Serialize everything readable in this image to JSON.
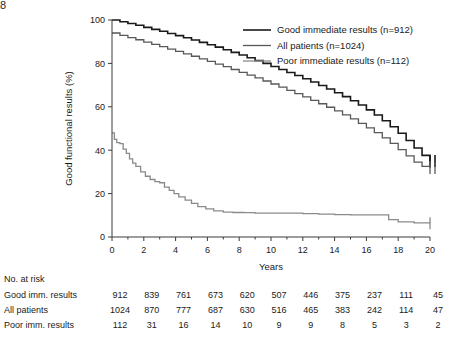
{
  "page_number": "8",
  "chart_data": {
    "type": "line",
    "title": "",
    "xlabel": "Years",
    "ylabel": "Good functional results (%)",
    "xlim": [
      0,
      20
    ],
    "ylim": [
      0,
      100
    ],
    "xticks": [
      0,
      2,
      4,
      6,
      8,
      10,
      12,
      14,
      16,
      18,
      20
    ],
    "xtick_labels": [
      "0",
      "2",
      "4",
      "6",
      "8",
      "10",
      "12",
      "14",
      "16",
      "18",
      "20"
    ],
    "yticks": [
      0,
      20,
      40,
      60,
      80,
      100
    ],
    "ytick_labels": [
      "0",
      "20",
      "40",
      "60",
      "80",
      "100"
    ],
    "xminor_interval": 1,
    "grid": false,
    "legend_position": "top-right",
    "series": [
      {
        "name": "Good immediate results (n=912)",
        "color": "#1a1a1a",
        "width": 1.6,
        "x": [
          0,
          0.5,
          1,
          1.5,
          2,
          2.5,
          3,
          3.5,
          4,
          4.5,
          5,
          5.5,
          6,
          6.5,
          7,
          7.5,
          8,
          8.5,
          9,
          9.5,
          10,
          10.5,
          11,
          11.5,
          12,
          12.5,
          13,
          13.5,
          14,
          14.5,
          15,
          15.5,
          16,
          16.5,
          17,
          17.5,
          18,
          18.5,
          19,
          19.5,
          20
        ],
        "y": [
          100,
          99.2,
          98.4,
          97.6,
          96.6,
          95.7,
          94.8,
          93.8,
          92.8,
          91.8,
          90.8,
          89.7,
          88.6,
          87.5,
          86.3,
          85.1,
          83.9,
          82.6,
          81.3,
          80.0,
          78.6,
          77.2,
          75.8,
          74.4,
          72.9,
          71.4,
          69.8,
          68.2,
          66.5,
          64.7,
          62.8,
          60.8,
          58.6,
          56.2,
          53.6,
          50.8,
          47.8,
          44.5,
          41.0,
          37.6,
          35.0
        ],
        "censor_x": [
          20,
          20
        ],
        "censor_y": [
          35.0,
          35.0
        ]
      },
      {
        "name": "All patients (n=1024)",
        "color": "#585858",
        "width": 1.3,
        "x": [
          0,
          0.5,
          1,
          1.5,
          2,
          2.5,
          3,
          3.5,
          4,
          4.5,
          5,
          5.5,
          6,
          6.5,
          7,
          7.5,
          8,
          8.5,
          9,
          9.5,
          10,
          10.5,
          11,
          11.5,
          12,
          12.5,
          13,
          13.5,
          14,
          14.5,
          15,
          15.5,
          16,
          16.5,
          17,
          17.5,
          18,
          18.5,
          19,
          19.5,
          20
        ],
        "y": [
          94.0,
          92.9,
          91.9,
          90.9,
          89.8,
          88.8,
          87.7,
          86.6,
          85.5,
          84.4,
          83.3,
          82.1,
          80.9,
          79.7,
          78.5,
          77.2,
          75.9,
          74.6,
          73.3,
          71.9,
          70.5,
          69.1,
          67.6,
          66.1,
          64.6,
          63.0,
          61.4,
          59.8,
          58.1,
          56.3,
          54.4,
          52.4,
          50.3,
          48.1,
          45.7,
          43.1,
          40.3,
          37.4,
          34.5,
          32.5,
          31.8
        ],
        "censor_x": [
          20,
          20
        ],
        "censor_y": [
          31.8,
          31.8
        ]
      },
      {
        "name": "Poor immediate results (n=112)",
        "color": "#8a8a8a",
        "width": 1.3,
        "x": [
          0,
          0.15,
          0.3,
          0.5,
          0.7,
          0.9,
          1.1,
          1.3,
          1.5,
          1.8,
          2.1,
          2.4,
          2.7,
          3.0,
          3.3,
          3.6,
          3.9,
          4.2,
          4.6,
          5.0,
          5.4,
          5.9,
          6.4,
          7.0,
          7.6,
          8.3,
          9.0,
          10.0,
          11.0,
          12.0,
          13.0,
          14.0,
          15.0,
          16.0,
          17.0,
          17.4,
          18.0,
          19.0,
          20.0
        ],
        "y": [
          48.0,
          45.0,
          43.5,
          43.0,
          40.5,
          38.5,
          36.0,
          34.0,
          32.5,
          30.0,
          28.0,
          26.5,
          25.5,
          25.0,
          23.0,
          21.5,
          20.0,
          18.5,
          17.0,
          15.5,
          14.0,
          13.0,
          12.0,
          11.5,
          11.3,
          11.2,
          11.0,
          11.0,
          11.0,
          10.8,
          10.5,
          10.3,
          10.2,
          10.2,
          10.2,
          8.0,
          7.0,
          6.5,
          6.3
        ],
        "censor_x": [
          20
        ],
        "censor_y": [
          6.3
        ]
      }
    ]
  },
  "risk_table": {
    "header": "No. at risk",
    "times": [
      0,
      2,
      4,
      6,
      8,
      10,
      12,
      14,
      16,
      18,
      20
    ],
    "rows": [
      {
        "label": "Good imm. results",
        "values": [
          "912",
          "839",
          "761",
          "673",
          "620",
          "507",
          "446",
          "375",
          "237",
          "111",
          "45"
        ]
      },
      {
        "label": "All patients",
        "values": [
          "1024",
          "870",
          "777",
          "687",
          "630",
          "516",
          "465",
          "383",
          "242",
          "114",
          "47"
        ]
      },
      {
        "label": "Poor imm. results",
        "values": [
          "112",
          "31",
          "16",
          "14",
          "10",
          "9",
          "9",
          "8",
          "5",
          "3",
          "2"
        ]
      }
    ]
  }
}
